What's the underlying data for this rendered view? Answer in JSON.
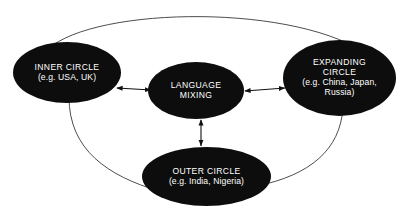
{
  "diagram": {
    "type": "concentric-circles-model",
    "background_color": "#ffffff",
    "node_fill_color": "#0d0d0d",
    "node_text_color": "#ffffff",
    "connector_color": "#2b2b2b",
    "nodes": {
      "inner": {
        "title": "INNER CIRCLE",
        "examples": "(e.g. USA, UK)"
      },
      "center": {
        "title_line_1": "LANGUAGE",
        "title_line_2": "MIXING"
      },
      "expanding": {
        "title_line_1": "EXPANDING",
        "title_line_2": "CIRCLE",
        "examples_line_1": "(e.g. China, Japan,",
        "examples_line_2": "Russia)"
      },
      "outer": {
        "title": "OUTER CIRCLE",
        "examples": "(e.g. India, Nigeria)"
      }
    },
    "connectors": [
      {
        "name": "inner-to-center",
        "style": "double-headed-arrow"
      },
      {
        "name": "center-to-expanding",
        "style": "double-headed-arrow"
      },
      {
        "name": "center-to-outer",
        "style": "double-headed-arrow"
      },
      {
        "name": "inner-to-expanding-arc",
        "style": "curved-line"
      },
      {
        "name": "inner-to-outer-arc",
        "style": "curved-line"
      },
      {
        "name": "outer-to-expanding-arc",
        "style": "curved-line"
      }
    ]
  }
}
